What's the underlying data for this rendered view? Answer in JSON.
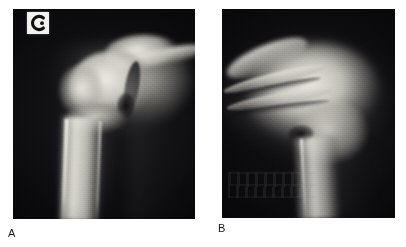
{
  "figure": {
    "type": "radiograph-figure",
    "panel_count": 2,
    "background_color": "#ffffff"
  },
  "panels": [
    {
      "id": "A",
      "caption": "A",
      "modality": "radiograph",
      "body_region": "shoulder",
      "view": "anteroposterior",
      "film_background_color": "#050506",
      "bone_color": "#d8d6cf",
      "marker": {
        "name": "laterality-marker",
        "glyph": "reversed-c",
        "plate_color": "#f2f1ed",
        "glyph_color": "#111111"
      }
    },
    {
      "id": "B",
      "caption": "B",
      "modality": "radiograph",
      "body_region": "shoulder",
      "view": "axillary-lateral",
      "film_background_color": "#050506",
      "bone_color": "#e2e0d8",
      "marker": null
    }
  ],
  "icons": {
    "laterality_marker": "reversed-c-icon"
  }
}
